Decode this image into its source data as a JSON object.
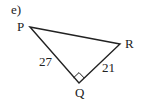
{
  "problem_label": "e)",
  "vertices": {
    "P": {
      "label": "P"
    },
    "Q": {
      "label": "Q"
    },
    "R": {
      "label": "R"
    }
  },
  "sides": {
    "PQ": {
      "length": "27"
    },
    "QR": {
      "length": "21"
    }
  },
  "right_angle_at": "Q",
  "colors": {
    "stroke": "#222222",
    "background": "#ffffff"
  }
}
